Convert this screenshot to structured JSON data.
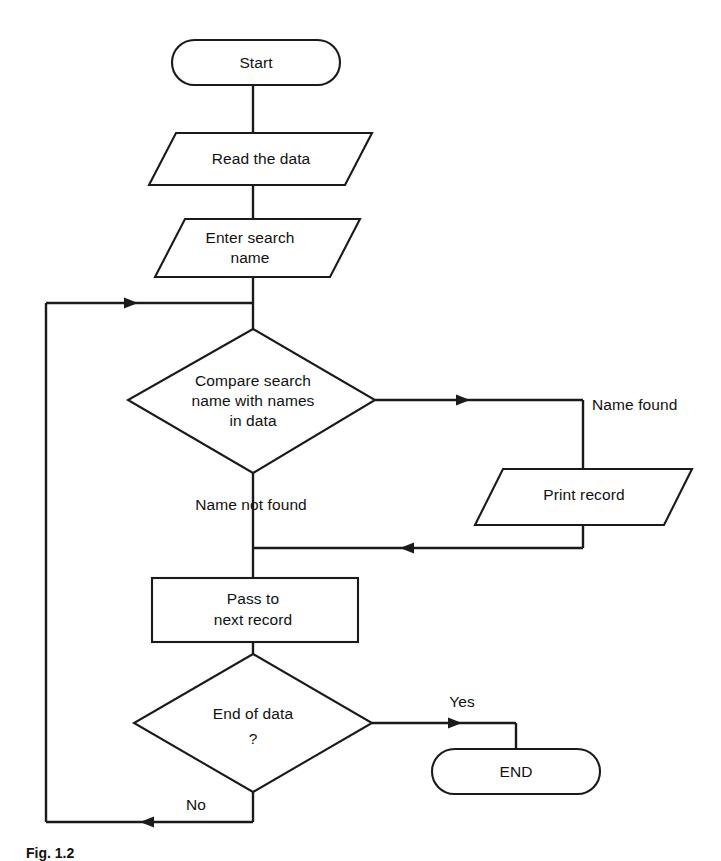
{
  "figure": {
    "caption": "Fig. 1.2",
    "background_color": "#ffffff",
    "line_color": "#1a1a1a"
  },
  "nodes": {
    "start": {
      "label": "Start",
      "type": "terminator"
    },
    "read_data": {
      "label": "Read the data",
      "type": "input-output"
    },
    "enter_name_line1": {
      "label": "Enter search",
      "type": "input-output"
    },
    "enter_name_line2": {
      "label": "name"
    },
    "compare_line1": {
      "label": "Compare search",
      "type": "decision"
    },
    "compare_line2": {
      "label": "name with names"
    },
    "compare_line3": {
      "label": "in data"
    },
    "print_record": {
      "label": "Print record",
      "type": "input-output"
    },
    "pass_next_line1": {
      "label": "Pass to",
      "type": "process"
    },
    "pass_next_line2": {
      "label": "next record"
    },
    "end_of_data_line1": {
      "label": "End of data",
      "type": "decision"
    },
    "end_of_data_line2": {
      "label": "?"
    },
    "end": {
      "label": "END",
      "type": "terminator"
    }
  },
  "edge_labels": {
    "name_found": "Name found",
    "name_not_found": "Name not found",
    "yes": "Yes",
    "no": "No"
  }
}
